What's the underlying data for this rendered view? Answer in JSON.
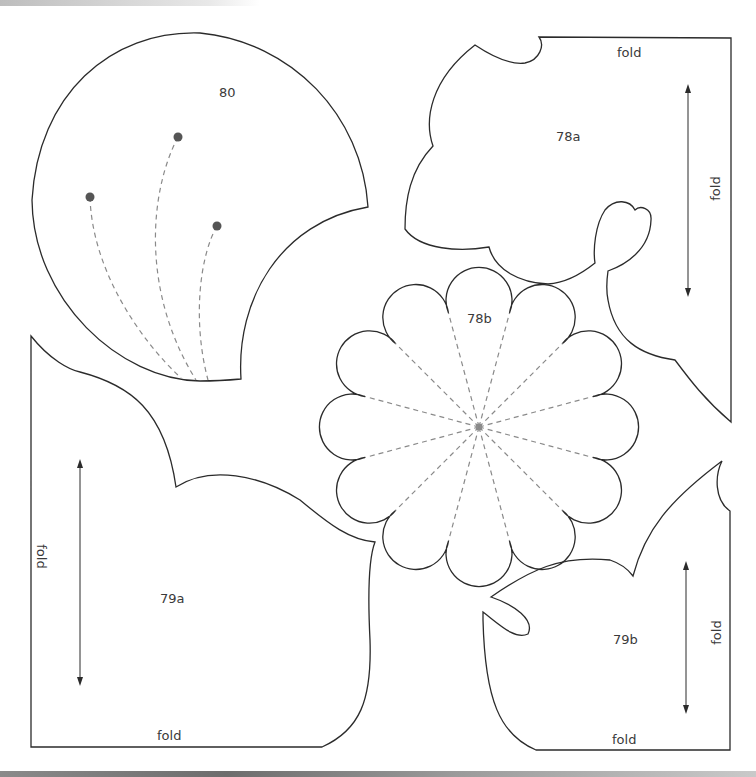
{
  "pieces": {
    "p80": {
      "label": "80"
    },
    "p78a": {
      "label": "78a",
      "fold_top": "fold",
      "fold_right": "fold"
    },
    "p78b": {
      "label": "78b"
    },
    "p79a": {
      "label": "79a",
      "fold_left": "fold",
      "fold_bottom": "fold"
    },
    "p79b": {
      "label": "79b",
      "fold_right": "fold",
      "fold_bottom": "fold"
    }
  },
  "colors": {
    "outline": "#2b2b2b",
    "dashed": "#8a8a8a",
    "dot": "#555555",
    "text": "#3a3a3a"
  }
}
